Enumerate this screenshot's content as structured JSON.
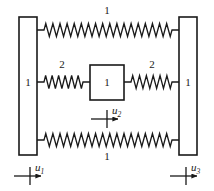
{
  "figure": {
    "type": "mechanical-schematic",
    "background_color": "#ffffff",
    "line_color": "#1a1a1a"
  },
  "walls": [
    {
      "id": "left-wall",
      "label": "1",
      "x": 19,
      "y": 17,
      "width": 18,
      "height": 138
    },
    {
      "id": "right-wall",
      "label": "1",
      "x": 179,
      "y": 17,
      "width": 18,
      "height": 138
    }
  ],
  "mass": {
    "id": "center-mass",
    "label": "1",
    "x": 90,
    "y": 65,
    "width": 34,
    "height": 35
  },
  "springs": [
    {
      "id": "spring-top",
      "label": "1",
      "label_x": 107,
      "label_y": 14,
      "x1": 37,
      "x2": 179,
      "y": 30,
      "coils": 18
    },
    {
      "id": "spring-middle-left",
      "label": "2",
      "label_x": 62,
      "label_y": 68,
      "x1": 37,
      "x2": 90,
      "y": 82,
      "coils": 6
    },
    {
      "id": "spring-middle-right",
      "label": "2",
      "label_x": 152,
      "label_y": 68,
      "x1": 124,
      "x2": 179,
      "y": 82,
      "coils": 6
    },
    {
      "id": "spring-bottom",
      "label": "1",
      "label_x": 107,
      "label_y": 160,
      "x1": 37,
      "x2": 179,
      "y": 140,
      "coils": 18
    }
  ],
  "displacements": [
    {
      "id": "u1",
      "symbol": "u",
      "subscript": "1",
      "tick_x": 30,
      "arrow_y": 176,
      "arrow_x1": 14,
      "arrow_x2": 44,
      "label_x": 35,
      "label_y": 171
    },
    {
      "id": "u2",
      "symbol": "u",
      "subscript": "2",
      "tick_x": 107,
      "arrow_y": 119,
      "arrow_x1": 91,
      "arrow_x2": 121,
      "label_x": 112,
      "label_y": 114
    },
    {
      "id": "u3",
      "symbol": "u",
      "subscript": "3",
      "tick_x": 186,
      "arrow_y": 176,
      "arrow_x1": 170,
      "arrow_x2": 200,
      "label_x": 191,
      "label_y": 171
    }
  ]
}
